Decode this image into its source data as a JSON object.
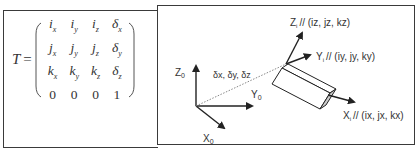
{
  "matrix": {
    "label": "T",
    "equals": "=",
    "rows": [
      [
        {
          "base": "i",
          "sub": "x"
        },
        {
          "base": "i",
          "sub": "y"
        },
        {
          "base": "i",
          "sub": "z"
        },
        {
          "base": "δ",
          "sub": "x"
        }
      ],
      [
        {
          "base": "j",
          "sub": "x"
        },
        {
          "base": "j",
          "sub": "y"
        },
        {
          "base": "j",
          "sub": "z"
        },
        {
          "base": "δ",
          "sub": "y"
        }
      ],
      [
        {
          "base": "k",
          "sub": "x"
        },
        {
          "base": "k",
          "sub": "y"
        },
        {
          "base": "k",
          "sub": "z"
        },
        {
          "base": "δ",
          "sub": "z"
        }
      ],
      [
        {
          "base": "0",
          "sub": ""
        },
        {
          "base": "0",
          "sub": ""
        },
        {
          "base": "0",
          "sub": ""
        },
        {
          "base": "1",
          "sub": ""
        }
      ]
    ]
  },
  "diagram": {
    "base_frame": {
      "z_label": "Z",
      "z_sub": "0",
      "y_label": "Y",
      "y_sub": "0",
      "x_label": "X",
      "x_sub": "0"
    },
    "translation_label": "δx, δy, δz",
    "tool_frame": {
      "z_label": "Z",
      "z_sub": "i",
      "z_desc": "// (iz, jz, kz)",
      "y_label": "Y",
      "y_sub": "i",
      "y_desc": "// (iy, jy, ky)",
      "x_label": "X",
      "x_sub": "i",
      "x_desc": "// (ix, jx, kx)"
    }
  },
  "colors": {
    "line": "#222222",
    "border": "#3a3a3a",
    "dotted": "#888888",
    "tool_face": "#cccccc"
  }
}
